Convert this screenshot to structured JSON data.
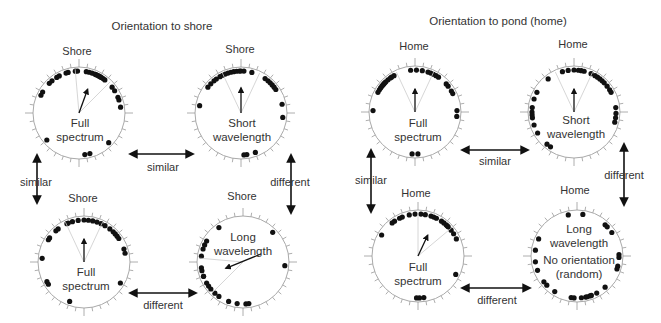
{
  "panels": [
    {
      "title": "Orientation to shore",
      "reference_label": "Shore",
      "plots": [
        {
          "id": "tl",
          "label_lines": [
            "Full",
            "spectrum"
          ]
        },
        {
          "id": "tr",
          "label_lines": [
            "Short",
            "wavelength"
          ]
        },
        {
          "id": "bl",
          "label_lines": [
            "Full",
            "spectrum"
          ]
        },
        {
          "id": "br",
          "label_lines": [
            "Long",
            "wavelength"
          ]
        }
      ],
      "comparisons": {
        "top": "similar",
        "left": "similar",
        "right": "different",
        "bottom": "different"
      }
    },
    {
      "title": "Orientation to pond (home)",
      "reference_label": "Home",
      "plots": [
        {
          "id": "tl",
          "label_lines": [
            "Full",
            "spectrum"
          ]
        },
        {
          "id": "tr",
          "label_lines": [
            "Short",
            "wavelength"
          ]
        },
        {
          "id": "bl",
          "label_lines": [
            "Full",
            "spectrum"
          ]
        },
        {
          "id": "br",
          "label_lines": [
            "Long",
            "wavelength",
            "No orientation",
            "(random)"
          ]
        }
      ],
      "comparisons": {
        "top": "similar",
        "left": "similar",
        "right": "different",
        "bottom": "different"
      }
    }
  ],
  "chart_data": {
    "type": "scatter",
    "subtype": "circular orientation diagrams",
    "plots": [
      {
        "panel": "Orientation to shore",
        "condition": "Full spectrum",
        "position": "top-left",
        "mean_angle_deg": 20,
        "mean_vector_length": 0.55,
        "angles_deg": [
          -65,
          -60,
          -45,
          -40,
          -32,
          -28,
          -18,
          -15,
          -5,
          -2,
          10,
          14,
          18,
          22,
          24,
          26,
          28,
          30,
          32,
          35,
          38,
          52,
          58,
          68,
          72,
          82,
          135,
          165,
          172,
          -130
        ]
      },
      {
        "panel": "Orientation to shore",
        "condition": "Short wavelength",
        "position": "top-right",
        "mean_angle_deg": 0,
        "mean_vector_length": 0.55,
        "angles_deg": [
          -52,
          -46,
          -40,
          -36,
          -30,
          -26,
          -22,
          -18,
          -14,
          -10,
          -6,
          0,
          4,
          -2,
          15,
          35,
          40,
          44,
          48,
          52,
          56,
          78,
          96,
          160,
          172,
          176,
          -80
        ]
      },
      {
        "panel": "Orientation to shore",
        "condition": "Full spectrum",
        "position": "bottom-left",
        "mean_angle_deg": 0,
        "mean_vector_length": 0.5,
        "angles_deg": [
          -58,
          -55,
          -42,
          -38,
          -24,
          -22,
          -16,
          -8,
          0,
          6,
          12,
          18,
          24,
          30,
          38,
          44,
          48,
          52,
          56,
          72,
          78,
          120,
          -118,
          -122,
          -160,
          -85
        ]
      },
      {
        "panel": "Orientation to shore",
        "condition": "Long wavelength",
        "position": "bottom-right",
        "mean_angle_deg": -110,
        "mean_vector_length": 0.4,
        "angles_deg": [
          -35,
          -60,
          -66,
          -72,
          -82,
          -98,
          -102,
          -110,
          -120,
          -125,
          -130,
          -138,
          -145,
          -160,
          -172,
          176,
          172,
          -110,
          45,
          95
        ]
      },
      {
        "panel": "Orientation to pond (home)",
        "condition": "Full spectrum",
        "position": "top-left",
        "mean_angle_deg": 0,
        "mean_vector_length": 0.5,
        "angles_deg": [
          -62,
          -58,
          -55,
          -52,
          -50,
          -48,
          -46,
          -44,
          -40,
          -36,
          -34,
          -30,
          -6,
          2,
          10,
          18,
          22,
          26,
          30,
          34,
          48,
          52,
          60,
          64,
          88,
          96,
          176,
          -176,
          -88
        ]
      },
      {
        "panel": "Orientation to pond (home)",
        "condition": "Short wavelength",
        "position": "top-right",
        "mean_angle_deg": 0,
        "mean_vector_length": 0.5,
        "angles_deg": [
          -38,
          -16,
          -8,
          0,
          6,
          14,
          10,
          24,
          30,
          34,
          38,
          42,
          46,
          52,
          58,
          62,
          84,
          92,
          98,
          104,
          -62,
          -72,
          -84,
          -90,
          -94,
          -98,
          -108,
          -120,
          -146,
          -140
        ]
      },
      {
        "panel": "Orientation to pond (home)",
        "condition": "Full spectrum",
        "position": "bottom-left",
        "mean_angle_deg": 25,
        "mean_vector_length": 0.5,
        "angles_deg": [
          -60,
          -38,
          -34,
          -26,
          -22,
          -12,
          -4,
          4,
          10,
          18,
          22,
          26,
          34,
          38,
          42,
          44,
          46,
          52,
          58,
          66,
          116,
          178,
          -178,
          172
        ]
      },
      {
        "panel": "Orientation to pond (home)",
        "condition": "Long wavelength (no orientation, random)",
        "position": "bottom-right",
        "mean_angle_deg": null,
        "mean_vector_length": 0,
        "angles_deg": [
          -12,
          8,
          42,
          46,
          56,
          88,
          92,
          104,
          108,
          138,
          152,
          162,
          168,
          174,
          -176,
          -172,
          -148,
          -134,
          -128,
          -110,
          -98,
          -82,
          -66,
          166,
          160
        ]
      }
    ],
    "comparisons": [
      {
        "panel": "Orientation to shore",
        "between": [
          "Full spectrum (top-left)",
          "Short wavelength"
        ],
        "result": "similar"
      },
      {
        "panel": "Orientation to shore",
        "between": [
          "Full spectrum (top-left)",
          "Full spectrum (bottom-left)"
        ],
        "result": "similar"
      },
      {
        "panel": "Orientation to shore",
        "between": [
          "Short wavelength",
          "Long wavelength"
        ],
        "result": "different"
      },
      {
        "panel": "Orientation to shore",
        "between": [
          "Full spectrum (bottom-left)",
          "Long wavelength"
        ],
        "result": "different"
      },
      {
        "panel": "Orientation to pond (home)",
        "between": [
          "Full spectrum (top-left)",
          "Short wavelength"
        ],
        "result": "similar"
      },
      {
        "panel": "Orientation to pond (home)",
        "between": [
          "Full spectrum (top-left)",
          "Full spectrum (bottom-left)"
        ],
        "result": "similar"
      },
      {
        "panel": "Orientation to pond (home)",
        "between": [
          "Short wavelength",
          "Long wavelength"
        ],
        "result": "different"
      },
      {
        "panel": "Orientation to pond (home)",
        "between": [
          "Full spectrum (bottom-left)",
          "Long wavelength"
        ],
        "result": "different"
      }
    ]
  }
}
